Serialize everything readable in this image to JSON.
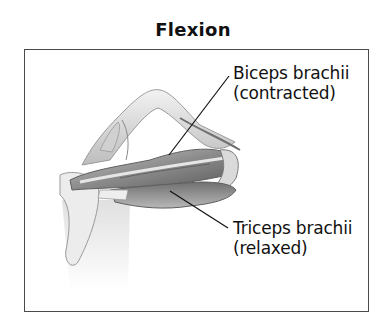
{
  "title": "Flexion",
  "labels": {
    "biceps": {
      "name": "Biceps brachii",
      "state": "(contracted)"
    },
    "triceps": {
      "name": "Triceps brachii",
      "state": "(relaxed)"
    }
  },
  "colors": {
    "frame": "#4a4a4a",
    "text": "#111111",
    "muscle_dark": "#6e6e6e",
    "muscle_mid": "#a8a8a8",
    "bone_light": "#dcdcdc"
  }
}
